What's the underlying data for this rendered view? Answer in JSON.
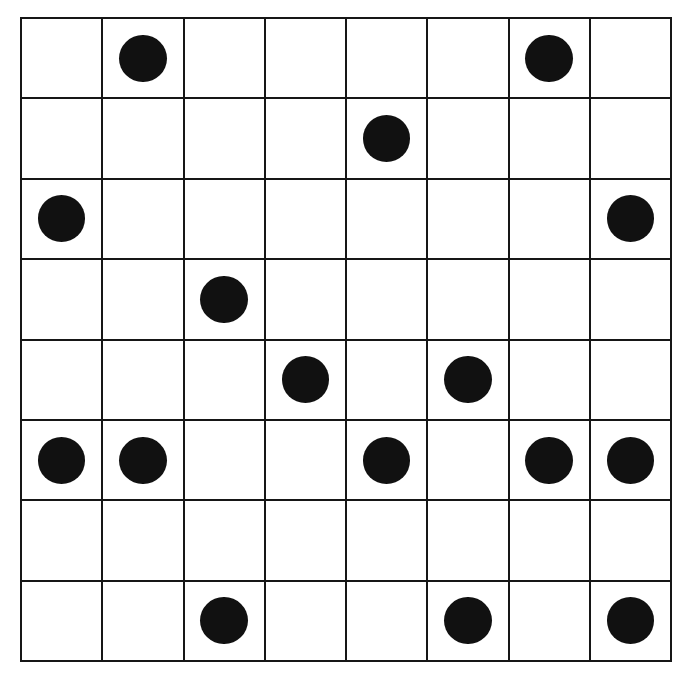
{
  "figure": {
    "type": "dot-grid",
    "rows": 8,
    "columns": 8,
    "background_color": "#ffffff",
    "line_color": "#161616",
    "dot_color": "#111111",
    "dot_relative_size": 0.6,
    "dot_count": 16,
    "empty_rows": [
      7
    ],
    "dot_cells_row_col": [
      [
        1,
        2
      ],
      [
        1,
        7
      ],
      [
        2,
        5
      ],
      [
        3,
        1
      ],
      [
        3,
        8
      ],
      [
        4,
        3
      ],
      [
        5,
        4
      ],
      [
        5,
        6
      ],
      [
        6,
        1
      ],
      [
        6,
        2
      ],
      [
        6,
        5
      ],
      [
        6,
        7
      ],
      [
        6,
        8
      ],
      [
        8,
        3
      ],
      [
        8,
        6
      ],
      [
        8,
        8
      ]
    ],
    "matrix": [
      [
        0,
        1,
        0,
        0,
        0,
        0,
        1,
        0
      ],
      [
        0,
        0,
        0,
        0,
        1,
        0,
        0,
        0
      ],
      [
        1,
        0,
        0,
        0,
        0,
        0,
        0,
        1
      ],
      [
        0,
        0,
        1,
        0,
        0,
        0,
        0,
        0
      ],
      [
        0,
        0,
        0,
        1,
        0,
        1,
        0,
        0
      ],
      [
        1,
        1,
        0,
        0,
        1,
        0,
        1,
        1
      ],
      [
        0,
        0,
        0,
        0,
        0,
        0,
        0,
        0
      ],
      [
        0,
        0,
        1,
        0,
        0,
        1,
        0,
        1
      ]
    ],
    "row_dot_counts": [
      2,
      1,
      2,
      1,
      2,
      5,
      0,
      3
    ],
    "column_dot_counts": [
      2,
      2,
      2,
      1,
      2,
      2,
      2,
      3
    ]
  }
}
